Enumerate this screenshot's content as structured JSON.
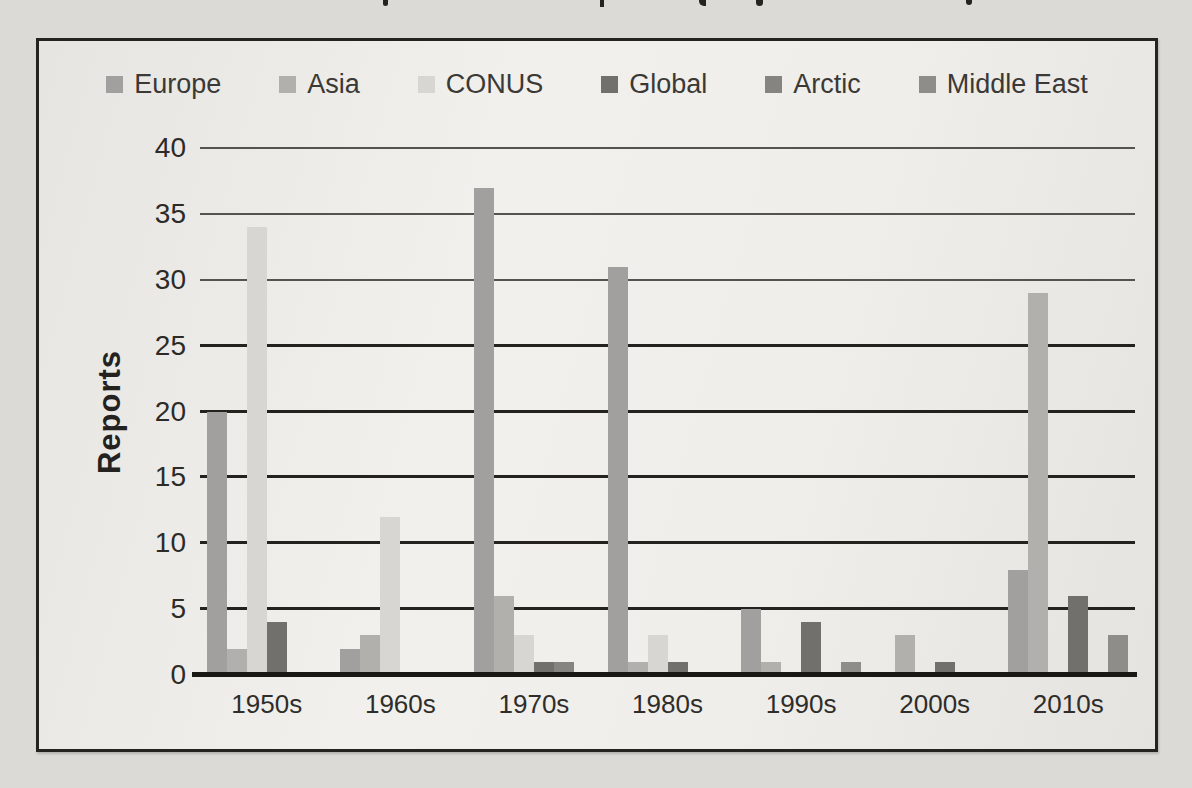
{
  "page": {
    "cropped_top_text": "illegible caption cut off at top edge; only letter descenders visible"
  },
  "chart_data": {
    "type": "bar",
    "title": "",
    "xlabel": "",
    "ylabel": "Reports",
    "ylim": [
      0,
      40
    ],
    "yticks": [
      0,
      5,
      10,
      15,
      20,
      25,
      30,
      35,
      40
    ],
    "grid": true,
    "legend_position": "top",
    "categories": [
      "1950s",
      "1960s",
      "1970s",
      "1980s",
      "1990s",
      "2000s",
      "2010s"
    ],
    "series": [
      {
        "name": "Europe",
        "color": "#a2a09e",
        "values": [
          20,
          2,
          37,
          31,
          5,
          0,
          8
        ]
      },
      {
        "name": "Asia",
        "color": "#b2b0ad",
        "values": [
          2,
          3,
          6,
          1,
          1,
          3,
          29
        ]
      },
      {
        "name": "CONUS",
        "color": "#d7d6d3",
        "values": [
          34,
          12,
          3,
          3,
          0,
          0,
          0
        ]
      },
      {
        "name": "Global",
        "color": "#71706d",
        "values": [
          4,
          0,
          1,
          1,
          4,
          1,
          6
        ]
      },
      {
        "name": "Arctic",
        "color": "#868481",
        "values": [
          0,
          0,
          1,
          0,
          0,
          0,
          0
        ]
      },
      {
        "name": "Middle East",
        "color": "#8f8d8a",
        "values": [
          0,
          0,
          0,
          0,
          1,
          0,
          3
        ]
      }
    ]
  }
}
